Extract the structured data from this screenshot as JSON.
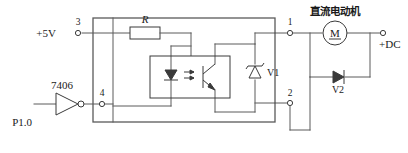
{
  "diagram": {
    "labels": {
      "supply": "+5V",
      "node3": "3",
      "node4": "4",
      "node1": "1",
      "node2": "2",
      "resistor": "R",
      "inverter_type": "7406",
      "port_pin": "P1.0",
      "zener": "V1",
      "flyback_diode": "V2",
      "motor_cn": "直流电动机",
      "motor_symbol": "M",
      "dc_supply": "+DC"
    },
    "icons": {
      "led": "led-diode-icon",
      "phototransistor": "phototransistor-icon",
      "light_arrows": "light-coupling-arrows-icon",
      "resistor": "resistor-icon",
      "inverter": "inverter-triangle-icon",
      "bubble": "inverting-bubble-icon",
      "zener": "zener-diode-icon",
      "diode": "diode-icon",
      "motor": "dc-motor-icon",
      "terminal": "terminal-node-icon"
    },
    "colors": {
      "wire": "#5a5a5a",
      "component": "#3a3a3a",
      "text": "#1a1a1a",
      "background": "#ffffff"
    }
  }
}
